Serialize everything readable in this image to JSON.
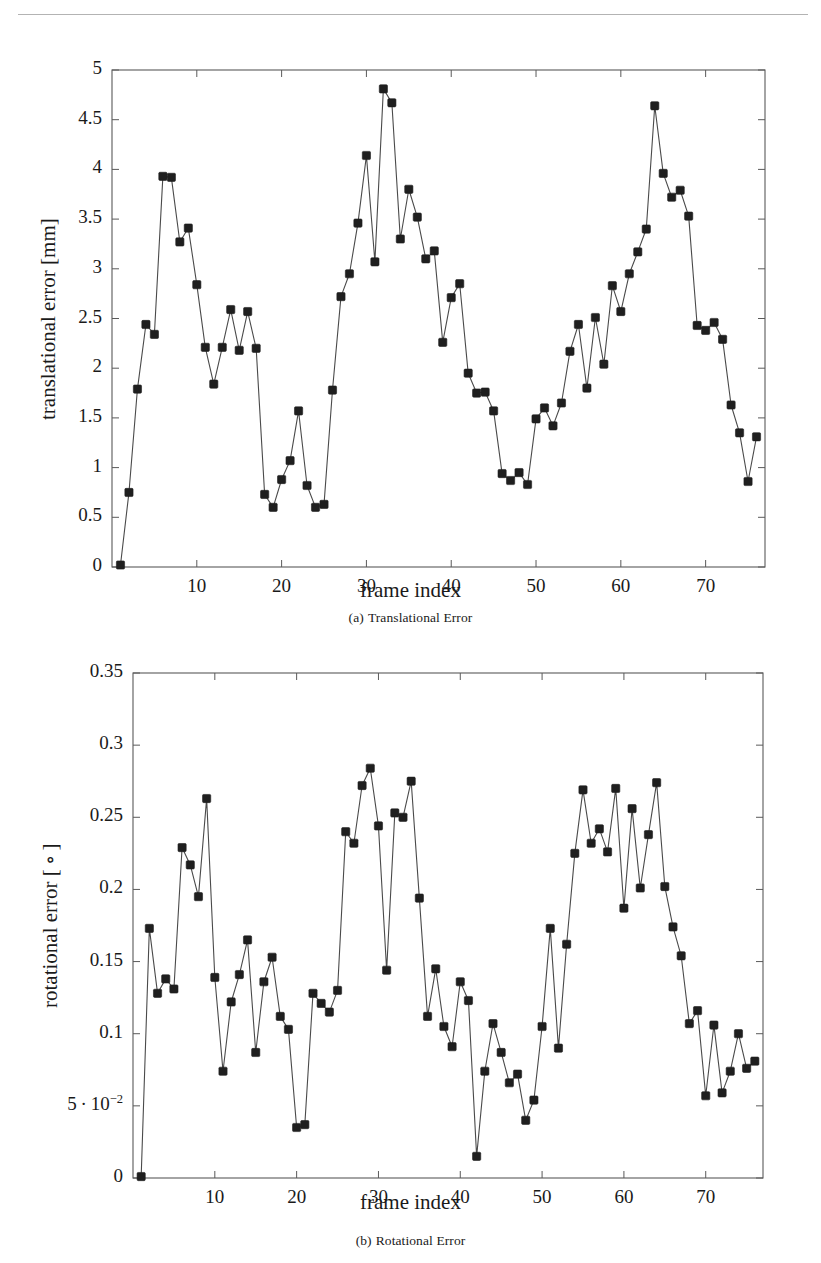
{
  "document": {
    "has_header_rule": true
  },
  "figures": [
    {
      "id": "fig-translational",
      "caption_label": "(a)",
      "caption_text": "Translational Error",
      "chart_key": 0
    },
    {
      "id": "fig-rotational",
      "caption_label": "(b)",
      "caption_text": "Rotational Error",
      "chart_key": 1
    }
  ],
  "chart_data": [
    {
      "type": "line",
      "title": "",
      "xlabel": "frame index",
      "ylabel": "translational error [mm]",
      "xlim": [
        0,
        77
      ],
      "ylim": [
        0,
        5
      ],
      "xticks": [
        10,
        20,
        30,
        40,
        50,
        60,
        70
      ],
      "xticklabels": [
        "10",
        "20",
        "30",
        "40",
        "50",
        "60",
        "70"
      ],
      "yticks": [
        0,
        0.5,
        1,
        1.5,
        2,
        2.5,
        3,
        3.5,
        4,
        4.5,
        5
      ],
      "yticklabels": [
        "0",
        "0.5",
        "1",
        "1.5",
        "2",
        "2.5",
        "3",
        "3.5",
        "4",
        "4.5",
        "5"
      ],
      "grid": false,
      "legend": false,
      "marker": "square",
      "marker_color": "#1f1f1f",
      "line_color": "#4a4a4a",
      "x": [
        1,
        2,
        3,
        4,
        5,
        6,
        7,
        8,
        9,
        10,
        11,
        12,
        13,
        14,
        15,
        16,
        17,
        18,
        19,
        20,
        21,
        22,
        23,
        24,
        25,
        26,
        27,
        28,
        29,
        30,
        31,
        32,
        33,
        34,
        35,
        36,
        37,
        38,
        39,
        40,
        41,
        42,
        43,
        44,
        45,
        46,
        47,
        48,
        49,
        50,
        51,
        52,
        53,
        54,
        55,
        56,
        57,
        58,
        59,
        60,
        61,
        62,
        63,
        64,
        65,
        66,
        67,
        68,
        69,
        70,
        71,
        72,
        73,
        74,
        75,
        76
      ],
      "values": [
        0.02,
        0.75,
        1.79,
        2.44,
        2.34,
        3.93,
        3.92,
        3.27,
        3.41,
        2.84,
        2.21,
        1.84,
        2.21,
        2.59,
        2.18,
        2.57,
        2.2,
        0.73,
        0.6,
        0.88,
        1.07,
        1.57,
        0.82,
        0.6,
        0.63,
        1.78,
        2.72,
        2.95,
        3.46,
        4.14,
        3.07,
        4.81,
        4.67,
        3.3,
        3.8,
        3.52,
        3.1,
        3.18,
        2.26,
        2.71,
        2.85,
        1.95,
        1.75,
        1.76,
        1.57,
        0.94,
        0.87,
        0.95,
        0.83,
        1.49,
        1.6,
        1.42,
        1.65,
        2.17,
        2.44,
        1.8,
        2.51,
        2.04,
        2.83,
        2.57,
        2.95,
        3.17,
        3.4,
        4.64,
        3.96,
        3.72,
        3.79,
        3.53,
        2.43,
        2.38,
        2.46,
        2.29,
        1.63,
        1.35,
        0.86,
        1.31
      ]
    },
    {
      "type": "line",
      "title": "",
      "xlabel": "frame index",
      "ylabel": "rotational error [ ∘ ]",
      "xlim": [
        0,
        77
      ],
      "ylim": [
        0,
        0.35
      ],
      "xticks": [
        10,
        20,
        30,
        40,
        50,
        60,
        70
      ],
      "xticklabels": [
        "10",
        "20",
        "30",
        "40",
        "50",
        "60",
        "70"
      ],
      "yticks": [
        0,
        0.05,
        0.1,
        0.15,
        0.2,
        0.25,
        0.3,
        0.35
      ],
      "yticklabels": [
        "0",
        "5 · 10⁻²",
        "0.1",
        "0.15",
        "0.2",
        "0.25",
        "0.3",
        "0.35"
      ],
      "grid": false,
      "legend": false,
      "marker": "square",
      "marker_color": "#1f1f1f",
      "line_color": "#4a4a4a",
      "x": [
        1,
        2,
        3,
        4,
        5,
        6,
        7,
        8,
        9,
        10,
        11,
        12,
        13,
        14,
        15,
        16,
        17,
        18,
        19,
        20,
        21,
        22,
        23,
        24,
        25,
        26,
        27,
        28,
        29,
        30,
        31,
        32,
        33,
        34,
        35,
        36,
        37,
        38,
        39,
        40,
        41,
        42,
        43,
        44,
        45,
        46,
        47,
        48,
        49,
        50,
        51,
        52,
        53,
        54,
        55,
        56,
        57,
        58,
        59,
        60,
        61,
        62,
        63,
        64,
        65,
        66,
        67,
        68,
        69,
        70,
        71,
        72,
        73,
        74,
        75,
        76
      ],
      "values": [
        0.001,
        0.173,
        0.128,
        0.138,
        0.131,
        0.229,
        0.217,
        0.195,
        0.263,
        0.139,
        0.074,
        0.122,
        0.141,
        0.165,
        0.087,
        0.136,
        0.153,
        0.112,
        0.103,
        0.035,
        0.037,
        0.128,
        0.121,
        0.115,
        0.13,
        0.24,
        0.232,
        0.272,
        0.284,
        0.244,
        0.144,
        0.253,
        0.25,
        0.275,
        0.194,
        0.112,
        0.145,
        0.105,
        0.091,
        0.136,
        0.123,
        0.015,
        0.074,
        0.107,
        0.087,
        0.066,
        0.072,
        0.04,
        0.054,
        0.105,
        0.173,
        0.09,
        0.162,
        0.225,
        0.269,
        0.232,
        0.242,
        0.226,
        0.27,
        0.187,
        0.256,
        0.201,
        0.238,
        0.274,
        0.202,
        0.174,
        0.154,
        0.107,
        0.116,
        0.057,
        0.106,
        0.059,
        0.074,
        0.1,
        0.076,
        0.081
      ]
    }
  ]
}
